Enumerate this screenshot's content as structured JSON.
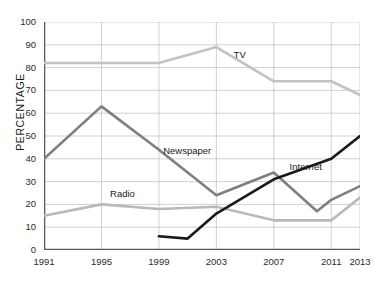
{
  "chart_data": {
    "type": "line",
    "title": "",
    "xlabel": "",
    "ylabel": "PERCENTAGE",
    "xlim": [
      1991,
      2013
    ],
    "ylim": [
      0,
      100
    ],
    "grid": true,
    "legend_position": "inline-annotations",
    "xticks": [
      "1991",
      "1995",
      "1999",
      "2003",
      "2007",
      "2011",
      "2013"
    ],
    "xtick_values": [
      1991,
      1995,
      1999,
      2003,
      2007,
      2011,
      2013
    ],
    "yticks": [
      "0",
      "10",
      "20",
      "30",
      "40",
      "50",
      "60",
      "70",
      "80",
      "90",
      "100"
    ],
    "ytick_values": [
      0,
      10,
      20,
      30,
      40,
      50,
      60,
      70,
      80,
      90,
      100
    ],
    "series": [
      {
        "name": "TV",
        "color": "#c2c2c2",
        "label_x": 2004.2,
        "label_y": 85,
        "x": [
          1991,
          1995,
          1999,
          2003,
          2007,
          2011,
          2013
        ],
        "values": [
          82,
          82,
          82,
          89,
          74,
          74,
          68
        ]
      },
      {
        "name": "Newspaper",
        "color": "#7f7f7f",
        "label_x": 1999.3,
        "label_y": 43,
        "x": [
          1991,
          1995,
          1999,
          2003,
          2007,
          2010,
          2011,
          2013
        ],
        "values": [
          40,
          63,
          44,
          24,
          34,
          17,
          22,
          28
        ]
      },
      {
        "name": "Radio",
        "color": "#b9b9b9",
        "label_x": 1995.6,
        "label_y": 24,
        "x": [
          1991,
          1995,
          1999,
          2003,
          2007,
          2010,
          2011,
          2013
        ],
        "values": [
          15,
          20,
          18,
          19,
          13,
          13,
          13,
          23
        ]
      },
      {
        "name": "Internet",
        "color": "#1a1a1a",
        "label_x": 2008.1,
        "label_y": 36,
        "x": [
          1999,
          2001,
          2003,
          2007,
          2011,
          2013
        ],
        "values": [
          6,
          5,
          16,
          31,
          40,
          50
        ]
      }
    ]
  }
}
